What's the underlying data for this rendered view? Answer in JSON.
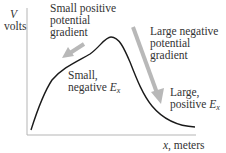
{
  "diagram": {
    "y_axis": {
      "symbol": "V",
      "unit": "volts"
    },
    "x_axis": {
      "symbol": "x",
      "unit": ", meters"
    },
    "annotations": {
      "small_gradient": {
        "line1": "Small positive",
        "line2": "potential",
        "line3": "gradient"
      },
      "large_gradient": {
        "line1": "Large negative",
        "line2": "potential",
        "line3": "gradient"
      },
      "small_field": {
        "line1": "Small,",
        "line2_prefix": "negative ",
        "symbol": "E",
        "subscript": "x"
      },
      "large_field": {
        "line1": "Large,",
        "line2_prefix": "positive ",
        "symbol": "E",
        "subscript": "x"
      }
    },
    "colors": {
      "curve": "#1a1a1a",
      "axis": "#b0b0b0",
      "arrow": "#b8b8b8",
      "text": "#333333"
    }
  }
}
